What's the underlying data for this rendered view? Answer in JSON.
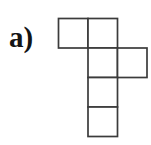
{
  "figure": {
    "label": "a)",
    "kind": "polyomino-net",
    "background_color": "#ffffff",
    "stroke_color": "#3b3b3b",
    "fill_color": "#ffffff",
    "stroke_width": 1.7,
    "grid": {
      "origin_x": 58.5,
      "origin_y": 18.5,
      "cell_size": 29.5,
      "columns": 3,
      "rows": 4
    },
    "squares": [
      {
        "name": "square-r1c1",
        "row": 0,
        "col": 0
      },
      {
        "name": "square-r1c2",
        "row": 0,
        "col": 1
      },
      {
        "name": "square-r2c2",
        "row": 1,
        "col": 1
      },
      {
        "name": "square-r2c3",
        "row": 1,
        "col": 2
      },
      {
        "name": "square-r3c2",
        "row": 2,
        "col": 1
      },
      {
        "name": "square-r4c2",
        "row": 3,
        "col": 1
      }
    ]
  }
}
